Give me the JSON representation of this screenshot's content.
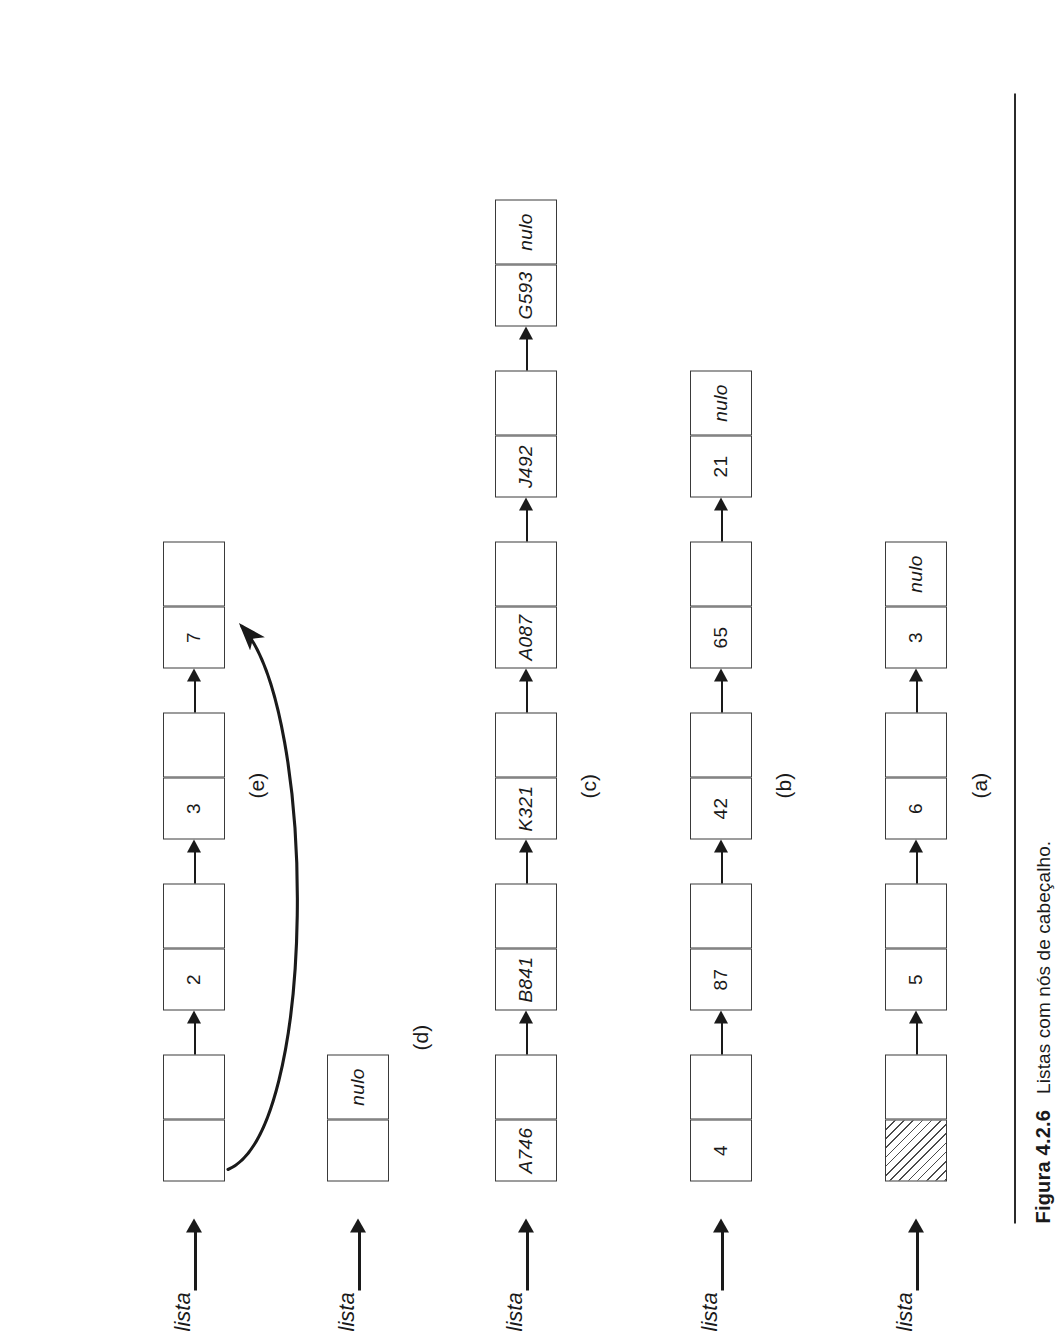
{
  "figure": {
    "caption_number": "Figura 4.2.6",
    "caption_text": "Listas com nós de cabeçalho.",
    "pointer_label": "lista",
    "null_label": "nulo",
    "ink_color": "#1a1a1a",
    "paper_color": "#ffffff"
  },
  "rows": [
    {
      "letter": "(a)",
      "pointer": "lista",
      "nodes": [
        {
          "data": "",
          "link": "",
          "data_style": "hatched"
        },
        {
          "data": "5",
          "link": ""
        },
        {
          "data": "6",
          "link": ""
        },
        {
          "data": "3",
          "link": "nulo"
        }
      ]
    },
    {
      "letter": "(b)",
      "pointer": "lista",
      "nodes": [
        {
          "data": "4",
          "link": ""
        },
        {
          "data": "87",
          "link": ""
        },
        {
          "data": "42",
          "link": ""
        },
        {
          "data": "65",
          "link": ""
        },
        {
          "data": "21",
          "link": "nulo"
        }
      ]
    },
    {
      "letter": "(c)",
      "pointer": "lista",
      "nodes": [
        {
          "data": "A746",
          "link": ""
        },
        {
          "data": "B841",
          "link": ""
        },
        {
          "data": "K321",
          "link": ""
        },
        {
          "data": "A087",
          "link": ""
        },
        {
          "data": "J492",
          "link": ""
        },
        {
          "data": "G593",
          "link": "nulo"
        }
      ]
    },
    {
      "letter": "(d)",
      "pointer": "lista",
      "nodes": [
        {
          "data": "",
          "link": "nulo"
        }
      ]
    },
    {
      "letter": "(e)",
      "pointer": "lista",
      "nodes": [
        {
          "data": "",
          "link": ""
        },
        {
          "data": "2",
          "link": ""
        },
        {
          "data": "3",
          "link": ""
        },
        {
          "data": "7",
          "link": ""
        }
      ],
      "circular_back_link": true
    }
  ]
}
